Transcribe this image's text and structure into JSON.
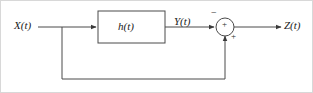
{
  "diagram": {
    "type": "block-diagram",
    "background_color": "#ffffff",
    "line_color": "#4a4a4a",
    "text_color": "#1a1a1a",
    "frame_color": "#d8d8d8",
    "labels": {
      "input": "X(t)",
      "block": "h(t)",
      "intermediate": "Y(t)",
      "output": "Z(t)"
    },
    "signs": {
      "summing_top_input": "−",
      "summing_center": "+",
      "summing_feedback_input": "+"
    },
    "nodes": [
      {
        "name": "input-source",
        "label": "X(t)"
      },
      {
        "name": "branch-point",
        "label": ""
      },
      {
        "name": "filter-block",
        "label": "h(t)"
      },
      {
        "name": "summing-junction",
        "label": "+"
      },
      {
        "name": "output-sink",
        "label": "Z(t)"
      }
    ],
    "edges": [
      {
        "from": "input-source",
        "to": "filter-block",
        "label": "X(t)"
      },
      {
        "from": "filter-block",
        "to": "summing-junction",
        "label": "Y(t)",
        "sign": "−"
      },
      {
        "from": "summing-junction",
        "to": "output-sink",
        "label": "Z(t)"
      },
      {
        "from": "branch-point",
        "to": "summing-junction",
        "label": "",
        "sign": "+",
        "path": "feedback"
      }
    ]
  }
}
